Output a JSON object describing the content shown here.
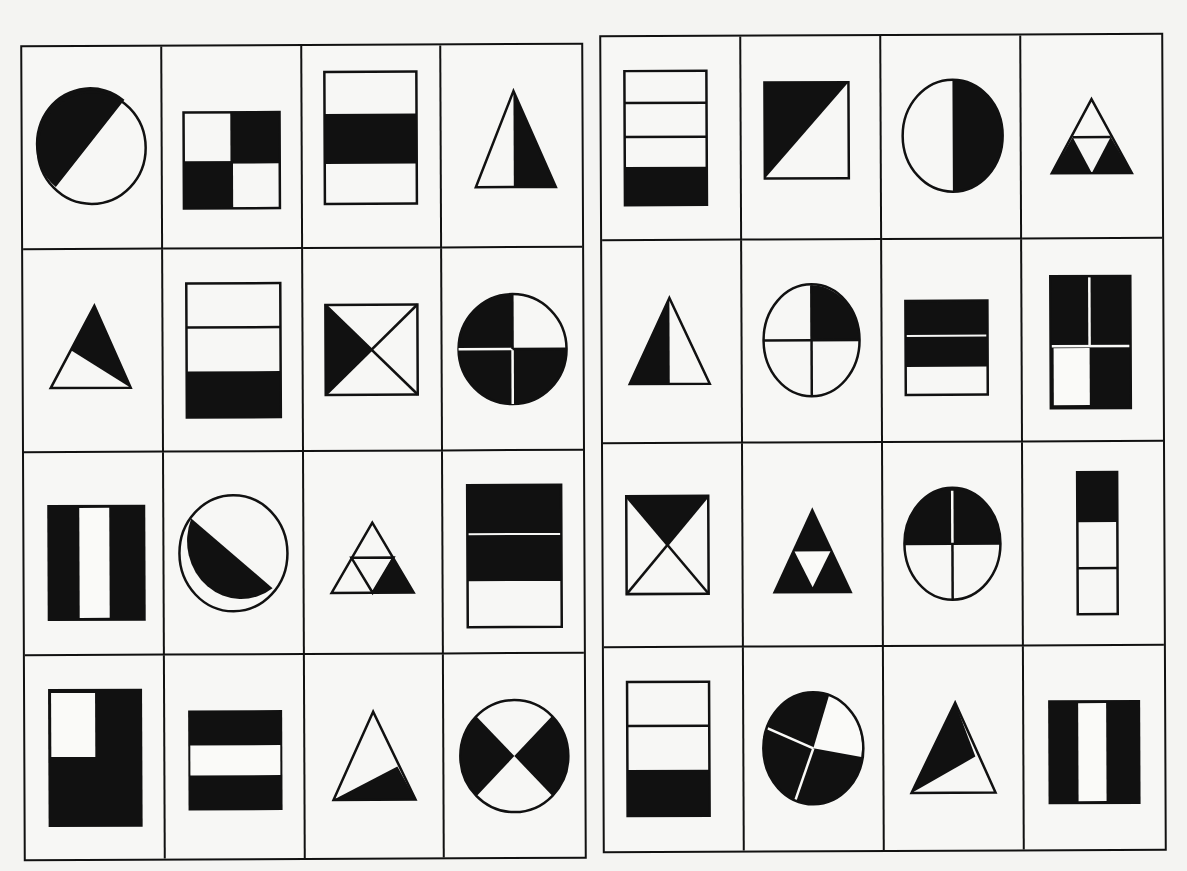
{
  "worksheet": {
    "title": "",
    "colors": {
      "ink": "#111111",
      "paper": "#f7f7f5"
    }
  },
  "grids": [
    {
      "id": "left",
      "rows": 4,
      "cols": 4,
      "cells": [
        {
          "shape": "circle",
          "parts": 2,
          "shaded": 1,
          "fraction": "1/2",
          "division": "diagonal"
        },
        {
          "shape": "square",
          "parts": 4,
          "shaded": 2,
          "fraction": "2/4",
          "division": "quadrants-checker"
        },
        {
          "shape": "rectangle",
          "parts": 3,
          "shaded": 1,
          "fraction": "1/3",
          "division": "horizontal-bands-middle"
        },
        {
          "shape": "triangle",
          "parts": 2,
          "shaded": 1,
          "fraction": "1/2",
          "division": "vertical-right"
        },
        {
          "shape": "triangle",
          "parts": 2,
          "shaded": 1,
          "fraction": "1/2",
          "division": "slanted-top"
        },
        {
          "shape": "rectangle",
          "parts": 3,
          "shaded": 1,
          "fraction": "1/3",
          "division": "horizontal-bands-bottom"
        },
        {
          "shape": "square",
          "parts": 4,
          "shaded": 1,
          "fraction": "1/4",
          "division": "diagonals-left"
        },
        {
          "shape": "circle",
          "parts": 4,
          "shaded": 3,
          "fraction": "3/4",
          "division": "quadrants"
        },
        {
          "shape": "rectangle",
          "parts": 3,
          "shaded": 2,
          "fraction": "2/3",
          "division": "vertical-bands-outer"
        },
        {
          "shape": "circle",
          "parts": 2,
          "shaded": 1,
          "fraction": "1/2",
          "division": "diagonal-lower"
        },
        {
          "shape": "triangle",
          "parts": 4,
          "shaded": 1,
          "fraction": "1/4",
          "division": "triforce-bottom-right"
        },
        {
          "shape": "rectangle",
          "parts": 3,
          "shaded": 2,
          "fraction": "2/3",
          "division": "horizontal-bands-top-two"
        },
        {
          "shape": "rectangle",
          "parts": 4,
          "shaded": 3,
          "fraction": "3/4",
          "division": "quadrants-L"
        },
        {
          "shape": "rectangle",
          "parts": 3,
          "shaded": 2,
          "fraction": "2/3",
          "division": "horizontal-bands-outer"
        },
        {
          "shape": "triangle",
          "parts": 2,
          "shaded": 1,
          "fraction": "1/2",
          "division": "slanted-bottom"
        },
        {
          "shape": "circle",
          "parts": 4,
          "shaded": 2,
          "fraction": "2/4",
          "division": "x-sides"
        }
      ]
    },
    {
      "id": "right",
      "rows": 4,
      "cols": 4,
      "cells": [
        {
          "shape": "rectangle",
          "parts": 4,
          "shaded": 1,
          "fraction": "1/4",
          "division": "horizontal-bands-bottom"
        },
        {
          "shape": "square",
          "parts": 2,
          "shaded": 1,
          "fraction": "1/2",
          "division": "diagonal-upper-left"
        },
        {
          "shape": "circle",
          "parts": 2,
          "shaded": 1,
          "fraction": "1/2",
          "division": "vertical-right"
        },
        {
          "shape": "triangle",
          "parts": 4,
          "shaded": 2,
          "fraction": "2/4",
          "division": "triforce-bottom-two"
        },
        {
          "shape": "triangle",
          "parts": 2,
          "shaded": 1,
          "fraction": "1/2",
          "division": "vertical-left"
        },
        {
          "shape": "circle",
          "parts": 4,
          "shaded": 1,
          "fraction": "1/4",
          "division": "quadrants-top-right"
        },
        {
          "shape": "rectangle",
          "parts": 3,
          "shaded": 2,
          "fraction": "2/3",
          "division": "horizontal-bands-top-two"
        },
        {
          "shape": "rectangle",
          "parts": 4,
          "shaded": 3,
          "fraction": "3/4",
          "division": "quadrants"
        },
        {
          "shape": "square",
          "parts": 4,
          "shaded": 1,
          "fraction": "1/4",
          "division": "diagonals-top"
        },
        {
          "shape": "triangle",
          "parts": 4,
          "shaded": 3,
          "fraction": "3/4",
          "division": "triforce-outer-three"
        },
        {
          "shape": "circle",
          "parts": 4,
          "shaded": 2,
          "fraction": "2/4",
          "division": "quadrants-top-half"
        },
        {
          "shape": "rectangle",
          "parts": 3,
          "shaded": 1,
          "fraction": "1/3",
          "division": "horizontal-bands-top"
        },
        {
          "shape": "rectangle",
          "parts": 3,
          "shaded": 1,
          "fraction": "1/3",
          "division": "horizontal-bands-bottom"
        },
        {
          "shape": "circle",
          "parts": 4,
          "shaded": 3,
          "fraction": "3/4",
          "division": "rotated-quadrants"
        },
        {
          "shape": "triangle",
          "parts": 2,
          "shaded": 1,
          "fraction": "1/2",
          "division": "slanted-top"
        },
        {
          "shape": "rectangle",
          "parts": 3,
          "shaded": 2,
          "fraction": "2/3",
          "division": "vertical-bands-outer"
        }
      ]
    }
  ]
}
